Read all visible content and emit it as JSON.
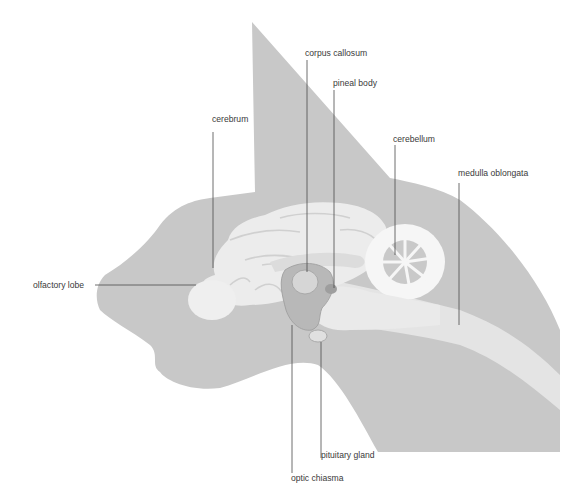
{
  "figure": {
    "colors": {
      "background": "#ffffff",
      "silhouette": "#c8c8c8",
      "brain": "#ececec",
      "brain_highlight": "#f4f4f4",
      "sulcus": "#d2d2d2",
      "cavity": "#b8b8b8",
      "label_text": "#3a3a3a",
      "leader_line": "#4a4a4a"
    }
  },
  "labels": {
    "corpus_callosum": "corpus callosum",
    "pineal_body": "pineal body",
    "cerebrum": "cerebrum",
    "cerebellum": "cerebellum",
    "medulla_oblongata": "medulla oblongata",
    "olfactory_lobe": "olfactory lobe",
    "pituitary_gland": "pituitary gland",
    "optic_chiasma": "optic chiasma"
  }
}
